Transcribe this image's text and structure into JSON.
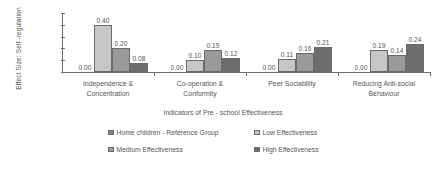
{
  "chart_data": {
    "type": "bar",
    "title": "",
    "xlabel": "Indicators of Pre - school Effectiveness",
    "ylabel": "Effect Size: Self -regulation",
    "ylim": [
      0.0,
      0.5
    ],
    "y_ticks": [
      "0.00",
      "0.10",
      "0.20",
      "0.30",
      "0.40",
      "0.50"
    ],
    "y_tick_values": [
      0.0,
      0.1,
      0.2,
      0.3,
      0.4,
      0.5
    ],
    "grid": false,
    "legend_position": "bottom",
    "categories": [
      "Independence & Concentration",
      "Co-operation & Conformity",
      "Peer Sociability",
      "Reducing Anti-social Behaviour"
    ],
    "category_lines": [
      [
        "Independence &",
        "Concentration"
      ],
      [
        "Co-operation &",
        "Conformity"
      ],
      [
        "Peer Sociability"
      ],
      [
        "Reducing Anti-social",
        "Behaviour"
      ]
    ],
    "series": [
      {
        "name": "Home children - Reference Group",
        "color": "#808080",
        "values": [
          0.0,
          0.0,
          0.0,
          0.0
        ],
        "labels": [
          "0.00",
          "0.00",
          "0.00",
          "0.00"
        ]
      },
      {
        "name": "Low Effectiveness",
        "color": "#c6c6c6",
        "values": [
          0.4,
          0.1,
          0.11,
          0.19
        ],
        "labels": [
          "0.40",
          "0.10",
          "0.11",
          "0.19"
        ]
      },
      {
        "name": "Medium Effectiveness",
        "color": "#9a9a9a",
        "values": [
          0.2,
          0.19,
          0.16,
          0.14
        ],
        "labels": [
          "0.20",
          "0.19",
          "0.16",
          "0.14"
        ]
      },
      {
        "name": "High Effectiveness",
        "color": "#6e6e6e",
        "values": [
          0.08,
          0.12,
          0.21,
          0.24
        ],
        "labels": [
          "0.08",
          "0.12",
          "0.21",
          "0.24"
        ]
      }
    ]
  },
  "legend": {
    "items": [
      {
        "label": "Home children - Reference Group",
        "color": "#808080"
      },
      {
        "label": "Low Effectiveness",
        "color": "#c6c6c6"
      },
      {
        "label": "Medium Effectiveness",
        "color": "#9a9a9a"
      },
      {
        "label": "High Effectiveness",
        "color": "#6e6e6e"
      }
    ]
  }
}
